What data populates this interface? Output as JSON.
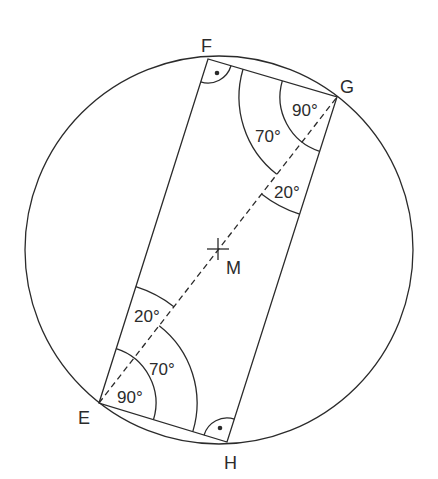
{
  "diagram": {
    "type": "inscribed-rectangle-in-circle",
    "circle": {
      "center_label": "M",
      "cx": 219,
      "cy": 250,
      "r": 193
    },
    "vertices": {
      "E": {
        "label": "E",
        "x": 99,
        "y": 403
      },
      "F": {
        "label": "F",
        "x": 208,
        "y": 59
      },
      "G": {
        "label": "G",
        "x": 337,
        "y": 97
      },
      "H": {
        "label": "H",
        "x": 227,
        "y": 442
      }
    },
    "diagonal": {
      "from": "E",
      "to": "G",
      "style": "dashed"
    },
    "center": {
      "label": "M",
      "x": 218,
      "y": 249
    },
    "right_angle_markers": [
      "F",
      "H"
    ],
    "angle_labels": {
      "g_full": "90°",
      "g_mid": "70°",
      "g_small": "20°",
      "e_small": "20°",
      "e_mid": "70°",
      "e_full": "90°"
    },
    "stroke_color": "#2b2b2b",
    "background": "#ffffff"
  }
}
